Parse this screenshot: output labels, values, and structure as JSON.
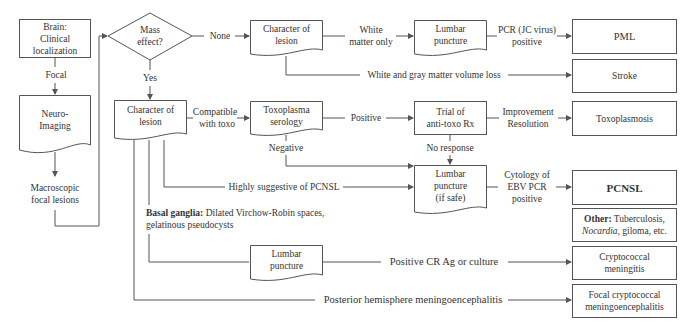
{
  "diagram": {
    "type": "flowchart",
    "colors": {
      "line": "#555555",
      "text": "#333333",
      "background": "#ffffff"
    },
    "nodes": {
      "brain": "Brain: Clinical localization",
      "brain_l1": "Brain:",
      "brain_l2": "Clinical",
      "brain_l3": "localization",
      "neuro_l1": "Neuro-",
      "neuro_l2": "Imaging",
      "macro_l1": "Macroscopic",
      "macro_l2": "focal lesions",
      "mass_l1": "Mass",
      "mass_l2": "effect?",
      "char1_l1": "Character of",
      "char1_l2": "lesion",
      "char2_l1": "Character of",
      "char2_l2": "lesion",
      "lp1_l1": "Lumbar",
      "lp1_l2": "puncture",
      "toxo_ser_l1": "Toxoplasma",
      "toxo_ser_l2": "serology",
      "trial_l1": "Trial of",
      "trial_l2": "anti-toxo Rx",
      "lp2_l1": "Lumbar",
      "lp2_l2": "puncture",
      "lp2_l3": "(if safe)",
      "lp3_l1": "Lumbar",
      "lp3_l2": "puncture",
      "pml": "PML",
      "stroke": "Stroke",
      "toxoplasmosis": "Toxoplasmosis",
      "pcnsl": "PCNSL",
      "other_bold": "Other:",
      "other_l1_rest": " Tuberculosis,",
      "other_italic": "Nocardia",
      "other_l2_rest": ", giloma, etc.",
      "crypto_l1": "Cryptococcal",
      "crypto_l2": "meningitis",
      "focal_crypto_l1": "Focal cryptococcal",
      "focal_crypto_l2": "meningoencephalitis"
    },
    "edge_labels": {
      "focal": "Focal",
      "none": "None",
      "yes": "Yes",
      "white_matter_l1": "White",
      "white_matter_l2": "matter only",
      "pcr_jc_l1": "PCR (JC virus)",
      "pcr_jc_l2": "positive",
      "white_gray": "White and gray matter volume loss",
      "compatible_l1": "Compatible",
      "compatible_l2": "with toxo",
      "positive": "Positive",
      "improvement_l1": "Improvement",
      "improvement_l2": "Resolution",
      "negative": "Negative",
      "no_response": "No response",
      "highly_suggestive": "Highly suggestive of PCNSL",
      "cytology_l1": "Cytology of",
      "cytology_l2": "EBV PCR",
      "cytology_l3": "positive",
      "basal_bold": "Basal ganglia:",
      "basal_rest": " Dilated Virchow-Robin spaces,",
      "basal_l2": "gelatinous pseudocysts",
      "positive_cr": "Positive CR Ag or culture",
      "posterior": "Posterior hemisphere meningoencephalitis"
    }
  }
}
